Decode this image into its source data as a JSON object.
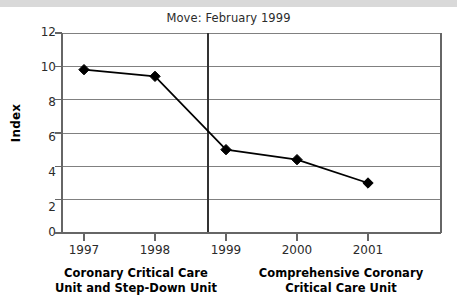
{
  "chart_data": {
    "type": "line",
    "title": "Move: February 1999",
    "xlabel": "",
    "ylabel": "Index",
    "categories": [
      "1997",
      "1998",
      "1999",
      "2000",
      "2001"
    ],
    "x": [
      1997,
      1998,
      1999,
      2000,
      2001
    ],
    "values": [
      9.8,
      9.4,
      5.0,
      4.4,
      3.0
    ],
    "series": [
      {
        "name": "Index",
        "values": [
          9.8,
          9.4,
          5.0,
          4.4,
          3.0
        ],
        "marker": "diamond",
        "color": "#000000"
      }
    ],
    "ylim": [
      0,
      12
    ],
    "yticks": [
      0,
      2,
      4,
      6,
      8,
      10,
      12
    ],
    "ytick_labels": [
      "0",
      "2",
      "4",
      "6",
      "8",
      "10",
      "12"
    ],
    "xtick_labels": [
      "1997",
      "1998",
      "1999",
      "2000",
      "2001"
    ],
    "grid": "horizontal",
    "legend": "none",
    "annotations": [
      {
        "type": "vertical-line",
        "label": "Move: February 1999",
        "x_position": 1998.75
      }
    ],
    "group_labels": [
      "Coronary Critical Care Unit and Step-Down Unit",
      "Comprehensive Coronary Critical Care Unit"
    ],
    "colors": {
      "line": "#000000",
      "marker": "#000000",
      "grid": "#808080",
      "axis": "#666666",
      "text": "#2b2b2b",
      "divider": "#333333",
      "background": "#ffffff",
      "top_band": "#d9d9d9"
    }
  },
  "title": {
    "text": "Move: February 1999"
  },
  "axes": {
    "y_axis_label": "Index",
    "y_ticks": [
      {
        "label": "12"
      },
      {
        "label": "10"
      },
      {
        "label": "8"
      },
      {
        "label": "6"
      },
      {
        "label": "4"
      },
      {
        "label": "2"
      },
      {
        "label": "0"
      }
    ],
    "x_ticks": [
      {
        "label": "1997"
      },
      {
        "label": "1998"
      },
      {
        "label": "1999"
      },
      {
        "label": "2000"
      },
      {
        "label": "2001"
      }
    ]
  },
  "groups": {
    "left": {
      "line1": "Coronary Critical Care",
      "line2": "Unit and Step-Down Unit"
    },
    "right": {
      "line1": "Comprehensive Coronary",
      "line2": "Critical Care Unit"
    }
  }
}
